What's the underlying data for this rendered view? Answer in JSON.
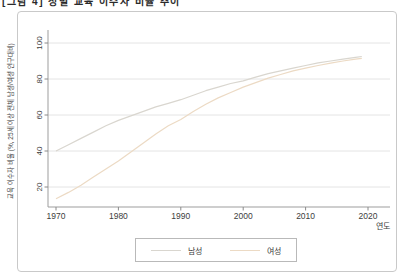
{
  "caption": "[그림 4] 성별 교육 이수자 비율 추이",
  "chart_data": {
    "type": "line",
    "title": "",
    "xlabel": "연도",
    "ylabel": "교육 이수자 비율 (%, 25세 이상 전체 남성/여성 인구대비)",
    "xticks": [
      1970,
      1980,
      1990,
      2000,
      2010,
      2020
    ],
    "yticks": [
      20,
      40,
      60,
      80,
      100
    ],
    "xlim": [
      1968.7,
      2023.5
    ],
    "ylim": [
      9,
      107
    ],
    "grid": "horizontal",
    "legend_position": "bottom",
    "series": [
      {
        "name": "남성",
        "color": "#d9d6cf",
        "points": [
          [
            1970,
            40
          ],
          [
            1972,
            43.5
          ],
          [
            1974,
            47
          ],
          [
            1976,
            50.5
          ],
          [
            1978,
            54
          ],
          [
            1980,
            57
          ],
          [
            1982,
            59.5
          ],
          [
            1984,
            62
          ],
          [
            1986,
            64.5
          ],
          [
            1988,
            66.5
          ],
          [
            1990,
            68.5
          ],
          [
            1992,
            71
          ],
          [
            1994,
            73.5
          ],
          [
            1996,
            75.5
          ],
          [
            1998,
            77.5
          ],
          [
            2000,
            79
          ],
          [
            2002,
            81
          ],
          [
            2004,
            83
          ],
          [
            2006,
            84.5
          ],
          [
            2008,
            86
          ],
          [
            2010,
            87.5
          ],
          [
            2012,
            89
          ],
          [
            2014,
            90
          ],
          [
            2016,
            91
          ],
          [
            2018,
            92
          ],
          [
            2019,
            92.5
          ]
        ]
      },
      {
        "name": "여성",
        "color": "#ecdac4",
        "points": [
          [
            1970,
            13.5
          ],
          [
            1972,
            17
          ],
          [
            1974,
            21
          ],
          [
            1976,
            25.5
          ],
          [
            1978,
            30
          ],
          [
            1980,
            34.5
          ],
          [
            1982,
            39.5
          ],
          [
            1984,
            44.5
          ],
          [
            1986,
            49.5
          ],
          [
            1988,
            54
          ],
          [
            1990,
            57.5
          ],
          [
            1992,
            62
          ],
          [
            1994,
            66
          ],
          [
            1996,
            69.5
          ],
          [
            1998,
            72.5
          ],
          [
            2000,
            75.5
          ],
          [
            2002,
            78
          ],
          [
            2004,
            80.5
          ],
          [
            2006,
            82.5
          ],
          [
            2008,
            84.5
          ],
          [
            2010,
            86
          ],
          [
            2012,
            87.5
          ],
          [
            2014,
            88.8
          ],
          [
            2016,
            90
          ],
          [
            2018,
            91
          ],
          [
            2019,
            91.5
          ]
        ]
      }
    ]
  },
  "legend": {
    "items": [
      {
        "label": "남성",
        "color": "#d9d6cf"
      },
      {
        "label": "여성",
        "color": "#ecdac4"
      }
    ]
  }
}
